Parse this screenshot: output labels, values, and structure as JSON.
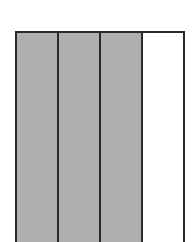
{
  "diagram": {
    "type": "fraction-model",
    "orientation": "vertical-strips",
    "total_parts": 4,
    "shaded_parts": 3,
    "parts": [
      {
        "index": 1,
        "shaded": true
      },
      {
        "index": 2,
        "shaded": true
      },
      {
        "index": 3,
        "shaded": true
      },
      {
        "index": 4,
        "shaded": false
      }
    ],
    "colors": {
      "shaded_fill": "#b4b4b4",
      "unshaded_fill": "#ffffff",
      "outline": "#2a2a2a"
    }
  }
}
